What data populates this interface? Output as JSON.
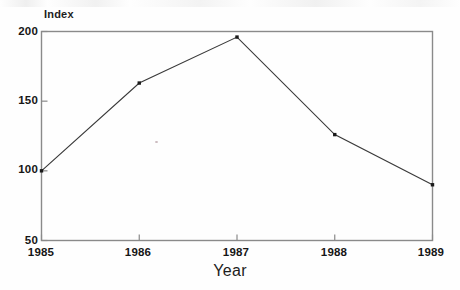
{
  "chart_data": {
    "type": "line",
    "title": "",
    "subtitle": "",
    "xlabel": "Year",
    "ylabel": "Index",
    "categories": [
      "1985",
      "1986",
      "1987",
      "1988",
      "1989"
    ],
    "x": [
      1985,
      1986,
      1987,
      1988,
      1989
    ],
    "values": [
      100,
      163,
      196,
      126,
      90
    ],
    "series": [
      {
        "name": "Index",
        "values": [
          100,
          163,
          196,
          126,
          90
        ]
      }
    ],
    "xlim": [
      1985,
      1989
    ],
    "ylim": [
      50,
      200
    ],
    "ytick_labels": [
      "50",
      "100",
      "150",
      "200"
    ],
    "ytick_values": [
      50,
      100,
      150,
      200
    ],
    "xtick_labels": [
      "1985",
      "1986",
      "1987",
      "1988",
      "1989"
    ],
    "xtick_values": [
      1985,
      1986,
      1987,
      1988,
      1989
    ],
    "grid": false,
    "legend": false,
    "legend_position": "none",
    "marker": "square",
    "line_color": "#3a3a3a",
    "marker_color": "#1a1a1a",
    "axis_color": "#8c8c8c",
    "background_color": "#fefefe",
    "annotations": []
  },
  "axes": {
    "y_title": "Index",
    "x_title": "Year"
  }
}
